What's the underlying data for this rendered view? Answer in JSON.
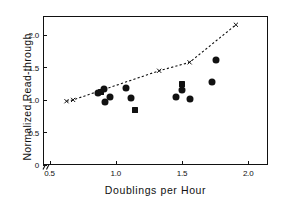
{
  "chart_data": {
    "type": "scatter",
    "title": "",
    "xlabel": "Doublings per Hour",
    "ylabel": "Normalized Read-through",
    "xlim": [
      0.45,
      2.15
    ],
    "ylim": [
      0.0,
      2.3
    ],
    "xticks": [
      "0.5",
      "1.0",
      "1.5",
      "2.0"
    ],
    "xtick_values": [
      0.5,
      1.0,
      1.5,
      2.0
    ],
    "yticks": [
      "0",
      "0.5",
      "1.0",
      "1.5",
      "2.0"
    ],
    "ytick_values": [
      0.0,
      0.5,
      1.0,
      1.5,
      2.0
    ],
    "grid": false,
    "legend": "none",
    "axis_break": {
      "axis": "x",
      "glyph": "double-slash",
      "between": [
        0.0,
        0.45
      ]
    },
    "series": [
      {
        "name": "Circle data points",
        "marker": "filled-circle",
        "color": "#111111",
        "points": [
          {
            "x": 0.86,
            "y": 1.12
          },
          {
            "x": 0.9,
            "y": 1.19
          },
          {
            "x": 0.91,
            "y": 0.99
          },
          {
            "x": 0.95,
            "y": 1.06
          },
          {
            "x": 1.07,
            "y": 1.21
          },
          {
            "x": 1.11,
            "y": 1.05
          },
          {
            "x": 1.45,
            "y": 1.06
          },
          {
            "x": 1.49,
            "y": 1.17
          },
          {
            "x": 1.55,
            "y": 1.04
          },
          {
            "x": 1.72,
            "y": 1.3
          },
          {
            "x": 1.75,
            "y": 1.63
          }
        ]
      },
      {
        "name": "Square data points",
        "marker": "filled-square",
        "color": "#111111",
        "points": [
          {
            "x": 0.88,
            "y": 1.14
          },
          {
            "x": 1.14,
            "y": 0.87
          },
          {
            "x": 1.49,
            "y": 1.26
          }
        ]
      },
      {
        "name": "Predicted trend",
        "marker": "x",
        "linestyle": "dashed",
        "color": "#111111",
        "points": [
          {
            "x": 0.62,
            "y": 1.0
          },
          {
            "x": 0.67,
            "y": 1.02
          },
          {
            "x": 0.9,
            "y": 1.18
          },
          {
            "x": 1.32,
            "y": 1.47
          },
          {
            "x": 1.55,
            "y": 1.6
          },
          {
            "x": 1.9,
            "y": 2.18
          }
        ]
      }
    ]
  }
}
